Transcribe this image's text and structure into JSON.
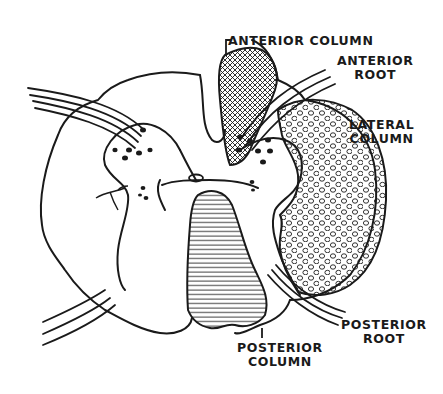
{
  "diagram": {
    "colors": {
      "ink": "#1a1a1a",
      "background": "#ffffff"
    },
    "labels": {
      "anterior_column": "ANTERIOR COLUMN",
      "anterior_root": {
        "line1": "ANTERIOR",
        "line2": "ROOT"
      },
      "lateral_column": {
        "line1": "LATERAL",
        "line2": "COLUMN"
      },
      "posterior_root": {
        "line1": "POSTERIOR",
        "line2": "ROOT"
      },
      "posterior_column": {
        "line1": "POSTERIOR",
        "line2": "COLUMN"
      }
    },
    "regions": [
      {
        "name": "anterior-column",
        "fill": "crosshatch"
      },
      {
        "name": "lateral-column",
        "fill": "circles"
      },
      {
        "name": "posterior-column",
        "fill": "horizontal-lines"
      }
    ]
  }
}
